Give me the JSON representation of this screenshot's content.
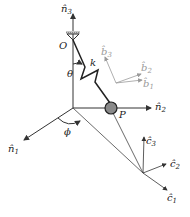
{
  "diagram": {
    "type": "pendulum-spring-frames",
    "labels": {
      "n3": "n̂",
      "n3_sub": "3",
      "n2": "n̂",
      "n2_sub": "2",
      "n1": "n̂",
      "n1_sub": "1",
      "origin": "O",
      "theta": "θ",
      "spring": "k",
      "phi": "ϕ",
      "point": "P",
      "b1": "b̂",
      "b1_sub": "1",
      "b2": "b̂",
      "b2_sub": "2",
      "b3": "b̂",
      "b3_sub": "3",
      "c1": "ĉ",
      "c1_sub": "1",
      "c2": "ĉ",
      "c2_sub": "2",
      "c3": "ĉ",
      "c3_sub": "3"
    },
    "colors": {
      "ink": "#222222",
      "frame_b": "#9a9a9a",
      "mass_fill": "#8a8a8a",
      "support": "#b0b0b0"
    }
  }
}
